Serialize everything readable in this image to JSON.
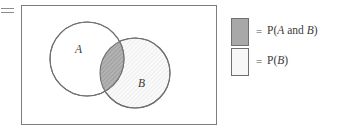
{
  "figure": {
    "equals_sign": "=",
    "venn": {
      "universe_label": "",
      "set_a_label": "A",
      "set_b_label": "B"
    },
    "legend": {
      "items": [
        {
          "equals": "=",
          "label": "P(A and B)",
          "label_prefix": "P(",
          "label_var1": "A",
          "label_mid": " and ",
          "label_var2": "B",
          "label_suffix": ")",
          "swatch_color": "#a8a8a8",
          "swatch_border": "#6f6f6f",
          "swatch_name": "intersection-swatch"
        },
        {
          "equals": "=",
          "label": "P(B)",
          "label_prefix": "P(",
          "label_var1": "B",
          "label_mid": "",
          "label_var2": "",
          "label_suffix": ")",
          "swatch_color": "#f7f7f7",
          "swatch_border": "#6f6f6f",
          "swatch_name": "set-b-swatch"
        }
      ]
    }
  },
  "chart_data": {
    "type": "diagram",
    "subtype": "venn",
    "title": "",
    "sets": [
      {
        "name": "A",
        "label": "A",
        "cx": 87,
        "cy": 59,
        "r": 37,
        "fill": "#ffffff",
        "stroke": "#707070",
        "hatched": false
      },
      {
        "name": "B",
        "label": "B",
        "cx": 135,
        "cy": 73,
        "r": 35,
        "fill": "#f7f7f7",
        "stroke": "#707070",
        "hatched": true
      }
    ],
    "intersection": {
      "name": "A and B",
      "fill": "#a8a8a8",
      "hatched": true,
      "highlighted": true
    },
    "universe": {
      "x": 21,
      "y": 5,
      "width": 196,
      "height": 120,
      "stroke": "#7d7d7d",
      "fill": "#ffffff"
    },
    "legend_entries": [
      "P(A and B)",
      "P(B)"
    ],
    "legend_position": "right"
  }
}
